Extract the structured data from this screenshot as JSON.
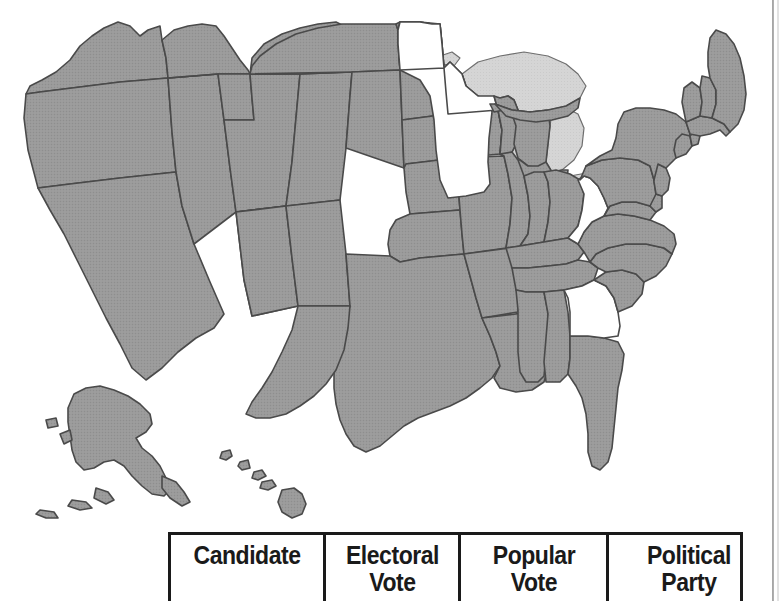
{
  "figure": {
    "type": "choropleth-map-with-table",
    "map": {
      "name": "united-states-electoral-map",
      "shaded_color": "#9a9a9a",
      "unshaded_color": "#ffffff",
      "lake_color": "#d5d5d5",
      "border_color": "#4a4a4a",
      "shaded_states": [
        "Washington",
        "Oregon",
        "California",
        "Nevada",
        "Idaho",
        "Montana",
        "Wyoming",
        "Utah",
        "Arizona",
        "Colorado",
        "New Mexico",
        "North Dakota",
        "South Dakota",
        "Nebraska",
        "Kansas",
        "Oklahoma",
        "Texas",
        "Iowa",
        "Missouri",
        "Arkansas",
        "Louisiana",
        "Wisconsin",
        "Illinois",
        "Michigan",
        "Indiana",
        "Ohio",
        "Kentucky",
        "Tennessee",
        "Mississippi",
        "Alabama",
        "Florida",
        "South Carolina",
        "North Carolina",
        "Virginia",
        "Maryland",
        "Delaware",
        "Pennsylvania",
        "New Jersey",
        "New York",
        "Connecticut",
        "Rhode Island",
        "Massachusetts",
        "Vermont",
        "New Hampshire",
        "Maine",
        "Alaska",
        "Hawaii"
      ],
      "unshaded_states": [
        "Minnesota",
        "West Virginia",
        "Georgia"
      ],
      "insets": [
        "Alaska",
        "Hawaii"
      ]
    }
  },
  "table": {
    "name": "election-results-table",
    "columns": [
      {
        "key": "candidate",
        "label": "Candidate"
      },
      {
        "key": "electoral_vote",
        "label_line1": "Electoral",
        "label_line2": "Vote"
      },
      {
        "key": "popular_vote",
        "label_line1": "Popular",
        "label_line2": "Vote"
      },
      {
        "key": "political_party",
        "label_line1": "Political",
        "label_line2": "Party"
      }
    ],
    "rows": []
  }
}
